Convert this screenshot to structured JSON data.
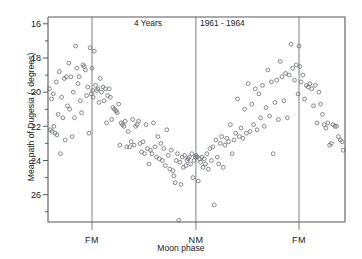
{
  "chart_data": {
    "type": "scatter",
    "title": "4 Years   1961 - 1964",
    "title_left": "4 Years",
    "title_right": "1961 - 1964",
    "xlabel": "Moon phase",
    "ylabel": "Mean path of Dugesia (- degrees)",
    "y_inverted": true,
    "ylim": [
      27.6,
      15.6
    ],
    "xlim": [
      0,
      1
    ],
    "grid": false,
    "legend": null,
    "y_major_ticks": [
      16,
      18,
      20,
      22,
      24,
      26
    ],
    "y_minor_ticks": [
      17,
      19,
      21,
      23,
      25,
      27
    ],
    "y_tick_labels": [
      "16",
      "18",
      "20",
      "22",
      "24",
      "26"
    ],
    "x_tick_labels": [
      "FM",
      "NM",
      "FM"
    ],
    "x_tick_positions": [
      0.148,
      0.498,
      0.845
    ],
    "vertical_reference_lines": [
      {
        "label": "FM",
        "x": 0.148
      },
      {
        "label": "NM",
        "x": 0.498
      },
      {
        "label": "FM",
        "x": 0.845
      }
    ],
    "marker": "open-circle",
    "marker_color": "#6e7377",
    "n_points": 190,
    "points": [
      [
        0.005,
        19.8
      ],
      [
        0.008,
        22.2
      ],
      [
        0.012,
        20.4
      ],
      [
        0.014,
        22.3
      ],
      [
        0.018,
        20.1
      ],
      [
        0.02,
        22.0
      ],
      [
        0.024,
        22.4
      ],
      [
        0.028,
        19.4
      ],
      [
        0.03,
        22.5
      ],
      [
        0.034,
        21.3
      ],
      [
        0.038,
        18.8
      ],
      [
        0.042,
        23.6
      ],
      [
        0.046,
        20.3
      ],
      [
        0.05,
        21.5
      ],
      [
        0.055,
        19.2
      ],
      [
        0.058,
        22.8
      ],
      [
        0.062,
        19.1
      ],
      [
        0.066,
        20.8
      ],
      [
        0.07,
        18.3
      ],
      [
        0.073,
        21.0
      ],
      [
        0.077,
        19.1
      ],
      [
        0.081,
        22.6
      ],
      [
        0.085,
        20.0
      ],
      [
        0.089,
        21.5
      ],
      [
        0.093,
        17.3
      ],
      [
        0.097,
        18.6
      ],
      [
        0.101,
        19.5
      ],
      [
        0.105,
        19.1
      ],
      [
        0.109,
        20.5
      ],
      [
        0.113,
        21.2
      ],
      [
        0.118,
        18.4
      ],
      [
        0.122,
        18.5
      ],
      [
        0.126,
        18.7
      ],
      [
        0.13,
        20.2
      ],
      [
        0.134,
        19.7
      ],
      [
        0.138,
        22.4
      ],
      [
        0.142,
        17.4
      ],
      [
        0.146,
        20.1
      ],
      [
        0.148,
        18.6
      ],
      [
        0.15,
        19.9
      ],
      [
        0.152,
        20.3
      ],
      [
        0.156,
        17.6
      ],
      [
        0.16,
        19.6
      ],
      [
        0.164,
        19.9
      ],
      [
        0.168,
        19.8
      ],
      [
        0.172,
        20.6
      ],
      [
        0.176,
        19.2
      ],
      [
        0.18,
        20.0
      ],
      [
        0.185,
        19.7
      ],
      [
        0.189,
        20.5
      ],
      [
        0.193,
        19.8
      ],
      [
        0.197,
        21.8
      ],
      [
        0.201,
        20.2
      ],
      [
        0.206,
        19.8
      ],
      [
        0.21,
        20.3
      ],
      [
        0.214,
        21.6
      ],
      [
        0.219,
        20.9
      ],
      [
        0.224,
        21.0
      ],
      [
        0.229,
        21.1
      ],
      [
        0.233,
        21.2
      ],
      [
        0.238,
        20.7
      ],
      [
        0.242,
        23.1
      ],
      [
        0.246,
        21.8
      ],
      [
        0.251,
        21.9
      ],
      [
        0.256,
        22.0
      ],
      [
        0.26,
        21.7
      ],
      [
        0.265,
        23.2
      ],
      [
        0.27,
        22.3
      ],
      [
        0.275,
        23.2
      ],
      [
        0.28,
        22.9
      ],
      [
        0.285,
        21.6
      ],
      [
        0.29,
        23.1
      ],
      [
        0.295,
        22.0
      ],
      [
        0.3,
        21.9
      ],
      [
        0.305,
        21.7
      ],
      [
        0.31,
        23.0
      ],
      [
        0.315,
        23.5
      ],
      [
        0.32,
        22.9
      ],
      [
        0.325,
        23.6
      ],
      [
        0.33,
        21.9
      ],
      [
        0.335,
        23.3
      ],
      [
        0.34,
        24.2
      ],
      [
        0.345,
        23.4
      ],
      [
        0.35,
        23.6
      ],
      [
        0.355,
        21.8
      ],
      [
        0.36,
        23.2
      ],
      [
        0.365,
        23.8
      ],
      [
        0.37,
        22.6
      ],
      [
        0.375,
        23.9
      ],
      [
        0.38,
        23.0
      ],
      [
        0.385,
        24.0
      ],
      [
        0.39,
        23.3
      ],
      [
        0.395,
        24.3
      ],
      [
        0.4,
        22.2
      ],
      [
        0.405,
        23.7
      ],
      [
        0.41,
        24.5
      ],
      [
        0.415,
        23.4
      ],
      [
        0.42,
        24.6
      ],
      [
        0.424,
        24.9
      ],
      [
        0.428,
        25.3
      ],
      [
        0.432,
        24.0
      ],
      [
        0.436,
        23.6
      ],
      [
        0.44,
        27.5
      ],
      [
        0.444,
        24.1
      ],
      [
        0.448,
        25.4
      ],
      [
        0.452,
        23.8
      ],
      [
        0.456,
        24.4
      ],
      [
        0.46,
        23.7
      ],
      [
        0.464,
        24.3
      ],
      [
        0.468,
        24.0
      ],
      [
        0.472,
        23.9
      ],
      [
        0.476,
        23.8
      ],
      [
        0.48,
        24.2
      ],
      [
        0.484,
        23.6
      ],
      [
        0.488,
        25.0
      ],
      [
        0.492,
        24.0
      ],
      [
        0.496,
        23.8
      ],
      [
        0.498,
        23.7
      ],
      [
        0.502,
        23.8
      ],
      [
        0.506,
        25.2
      ],
      [
        0.51,
        23.9
      ],
      [
        0.514,
        24.1
      ],
      [
        0.518,
        23.8
      ],
      [
        0.522,
        24.4
      ],
      [
        0.526,
        23.9
      ],
      [
        0.53,
        24.2
      ],
      [
        0.535,
        23.6
      ],
      [
        0.54,
        24.5
      ],
      [
        0.545,
        23.3
      ],
      [
        0.55,
        24.0
      ],
      [
        0.555,
        23.2
      ],
      [
        0.56,
        26.6
      ],
      [
        0.565,
        22.8
      ],
      [
        0.57,
        23.8
      ],
      [
        0.575,
        24.2
      ],
      [
        0.58,
        23.0
      ],
      [
        0.585,
        22.6
      ],
      [
        0.59,
        24.4
      ],
      [
        0.596,
        23.1
      ],
      [
        0.602,
        22.7
      ],
      [
        0.608,
        22.9
      ],
      [
        0.614,
        21.9
      ],
      [
        0.62,
        23.6
      ],
      [
        0.626,
        22.8
      ],
      [
        0.632,
        22.4
      ],
      [
        0.638,
        20.4
      ],
      [
        0.644,
        22.6
      ],
      [
        0.65,
        22.1
      ],
      [
        0.656,
        22.7
      ],
      [
        0.662,
        21.0
      ],
      [
        0.668,
        22.4
      ],
      [
        0.674,
        19.5
      ],
      [
        0.68,
        22.3
      ],
      [
        0.686,
        20.7
      ],
      [
        0.692,
        21.9
      ],
      [
        0.698,
        19.8
      ],
      [
        0.704,
        22.2
      ],
      [
        0.71,
        20.1
      ],
      [
        0.716,
        21.5
      ],
      [
        0.722,
        19.6
      ],
      [
        0.728,
        22.0
      ],
      [
        0.734,
        20.9
      ],
      [
        0.74,
        18.7
      ],
      [
        0.746,
        21.4
      ],
      [
        0.752,
        19.4
      ],
      [
        0.758,
        23.6
      ],
      [
        0.764,
        20.6
      ],
      [
        0.77,
        19.3
      ],
      [
        0.776,
        21.6
      ],
      [
        0.782,
        18.2
      ],
      [
        0.788,
        19.1
      ],
      [
        0.794,
        20.5
      ],
      [
        0.8,
        18.9
      ],
      [
        0.806,
        21.5
      ],
      [
        0.812,
        19.0
      ],
      [
        0.818,
        17.2
      ],
      [
        0.824,
        18.6
      ],
      [
        0.83,
        19.3
      ],
      [
        0.836,
        18.4
      ],
      [
        0.842,
        20.1
      ],
      [
        0.845,
        17.3
      ],
      [
        0.848,
        18.5
      ],
      [
        0.852,
        19.4
      ],
      [
        0.858,
        19.0
      ],
      [
        0.864,
        20.4
      ],
      [
        0.87,
        19.6
      ],
      [
        0.876,
        19.7
      ],
      [
        0.882,
        19.5
      ],
      [
        0.888,
        19.8
      ],
      [
        0.894,
        20.8
      ],
      [
        0.9,
        19.6
      ],
      [
        0.906,
        21.8
      ],
      [
        0.912,
        20.0
      ],
      [
        0.918,
        20.7
      ],
      [
        0.924,
        21.3
      ],
      [
        0.93,
        21.9
      ],
      [
        0.936,
        22.1
      ],
      [
        0.942,
        21.8
      ],
      [
        0.948,
        23.1
      ],
      [
        0.954,
        23.0
      ],
      [
        0.96,
        21.9
      ],
      [
        0.966,
        22.0
      ],
      [
        0.972,
        22.0
      ],
      [
        0.978,
        22.6
      ],
      [
        0.984,
        22.8
      ],
      [
        0.99,
        22.9
      ],
      [
        0.994,
        23.4
      ]
    ]
  }
}
